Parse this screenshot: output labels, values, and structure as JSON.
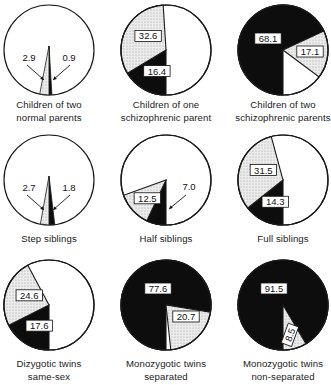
{
  "chart_data": {
    "type": "pie",
    "title": "",
    "segment_legend": {
      "black": "Schizophrenia (definite)",
      "stippled": "Schizophrenia (probable / borderline)",
      "white": "Unaffected remainder"
    },
    "note": "Values shown are percentages; black wedge = first value, stippled wedge = second value, white = remainder to 100.",
    "charts": [
      {
        "id": "children-two-normal",
        "caption": [
          "Children of two",
          "normal parents"
        ],
        "black": 0.9,
        "stippled": 2.9,
        "labels": [
          "2.9",
          "0.9"
        ],
        "label_style": "arrows"
      },
      {
        "id": "children-one-schizo",
        "caption": [
          "Children of one",
          "schizophrenic parent"
        ],
        "black": 16.4,
        "stippled": 32.6,
        "labels": [
          "32.6",
          "16.4"
        ],
        "label_style": "boxed"
      },
      {
        "id": "children-two-schizo",
        "caption": [
          "Children of two",
          "schizophrenic parents"
        ],
        "black": 68.1,
        "stippled": 17.1,
        "labels": [
          "68.1",
          "17.1"
        ],
        "label_style": "boxed"
      },
      {
        "id": "step-siblings",
        "caption": [
          "Step siblings"
        ],
        "black": 1.8,
        "stippled": 2.7,
        "labels": [
          "2.7",
          "1.8"
        ],
        "label_style": "arrows"
      },
      {
        "id": "half-siblings",
        "caption": [
          "Half siblings"
        ],
        "black": 7.0,
        "stippled": 12.5,
        "labels": [
          "12.5",
          "7.0"
        ],
        "label_style": "mixed"
      },
      {
        "id": "full-siblings",
        "caption": [
          "Full siblings"
        ],
        "black": 14.3,
        "stippled": 31.5,
        "labels": [
          "31.5",
          "14.3"
        ],
        "label_style": "boxed"
      },
      {
        "id": "dz-twins-same-sex",
        "caption": [
          "Dizygotic twins",
          "same-sex"
        ],
        "black": 17.6,
        "stippled": 24.6,
        "labels": [
          "24.6",
          "17.6"
        ],
        "label_style": "boxed"
      },
      {
        "id": "mz-twins-separated",
        "caption": [
          "Monozygotic twins",
          "separated"
        ],
        "black": 77.6,
        "stippled": 20.7,
        "labels": [
          "77.6",
          "20.7"
        ],
        "label_style": "boxed"
      },
      {
        "id": "mz-twins-non-separated",
        "caption": [
          "Monozygotic twins",
          "non-separated"
        ],
        "black": 91.5,
        "stippled": 8.5,
        "labels": [
          "91.5",
          "8.5"
        ],
        "label_style": "boxed"
      }
    ]
  },
  "captions": {
    "c0": [
      "Children of two",
      "normal parents"
    ],
    "c1": [
      "Children of one",
      "schizophrenic parent"
    ],
    "c2": [
      "Children of two",
      "schizophrenic parents"
    ],
    "c3": [
      "Step siblings"
    ],
    "c4": [
      "Half siblings"
    ],
    "c5": [
      "Full siblings"
    ],
    "c6": [
      "Dizygotic twins",
      "same-sex"
    ],
    "c7": [
      "Monozygotic twins",
      "separated"
    ],
    "c8": [
      "Monozygotic twins",
      "non-separated"
    ]
  },
  "colors": {
    "black": "#0d0d0d",
    "stippled": "#e6e6e6",
    "white": "#ffffff",
    "outline": "#1a1a1a"
  }
}
